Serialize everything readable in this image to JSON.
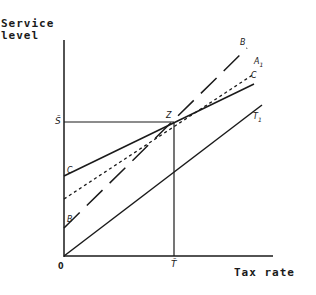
{
  "diagram": {
    "y_axis_label_line1": "Service",
    "y_axis_label_line2": "level",
    "x_axis_label": "Tax rate",
    "origin_label": "0",
    "s_bar_label": "S̄",
    "t_bar_label": "T̄",
    "point_label": "Z",
    "lines": [
      {
        "name": "B",
        "style": "long-dashed",
        "label": "B",
        "left_label": "B"
      },
      {
        "name": "A1",
        "style": "short-dashed",
        "label": "A",
        "subscript": "1"
      },
      {
        "name": "C",
        "style": "solid",
        "label": "C",
        "left_label": "C"
      },
      {
        "name": "T1",
        "style": "solid",
        "label": "T",
        "subscript": "1"
      }
    ],
    "colors": {
      "ink": "#1a1a1a",
      "background": "#ffffff"
    }
  }
}
